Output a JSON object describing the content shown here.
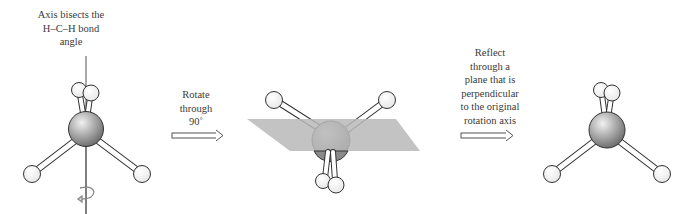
{
  "steps": [
    {
      "id": "original",
      "caption": [
        "Axis bisects the",
        "H–C–H bond",
        "angle"
      ]
    },
    {
      "id": "rotate",
      "caption": [
        "Rotate",
        "through",
        "90˚"
      ]
    },
    {
      "id": "reflect",
      "caption": [
        "Reflect",
        "through a",
        "plane that is",
        "perpendicular",
        "to the original",
        "rotation axis"
      ]
    }
  ],
  "colors": {
    "carbon": "#9a9a9a",
    "hydrogen": "#ffffff",
    "outline": "#333333",
    "plane": "#b8b8b8",
    "axis": "#555555",
    "text": "#3a3a3a"
  },
  "icons": {
    "rotation": "rotation-arrow-icon",
    "step_arrow": "double-line-right-arrow-icon"
  }
}
